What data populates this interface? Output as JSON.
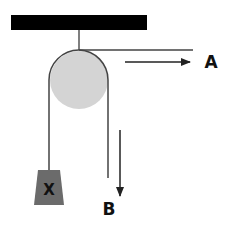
{
  "diagram": {
    "type": "pulley-system",
    "colors": {
      "ceiling": "#000000",
      "rope": "#555555",
      "pulley_fill": "#d4d4d4",
      "pulley_edge": "#333333",
      "weight_fill": "#6b6b6b",
      "arrow": "#222222",
      "label": "#111111"
    },
    "labels": {
      "a": "A",
      "b": "B",
      "weight": "X"
    },
    "arrows": [
      {
        "name": "arrow-a",
        "direction": "right"
      },
      {
        "name": "arrow-b",
        "direction": "down"
      }
    ]
  }
}
